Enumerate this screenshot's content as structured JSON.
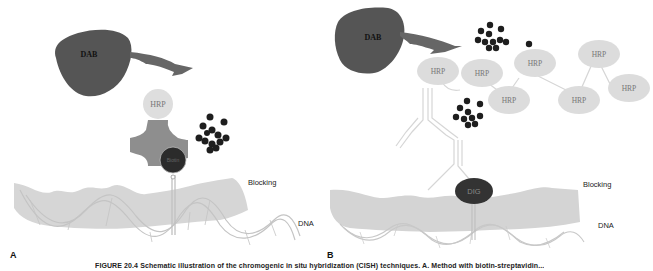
{
  "colors": {
    "dab": "#555555",
    "hrp": "#dcdcdc",
    "streptavidin": "#8c8c8c",
    "biotin": "#2b2b2b",
    "dig": "#333333",
    "precipitate": "#1e1e1e",
    "blocking": "#d4d4d4",
    "dna_strand": "#c8c8c8"
  },
  "panel_a": {
    "panel_label": "A",
    "dab_label": "DAB",
    "hrp_label": "HRP",
    "biotin_label": "Biotin",
    "blocking_label": "Blocking",
    "dna_label": "DNA"
  },
  "panel_b": {
    "panel_label": "B",
    "dab_label": "DAB",
    "hrp_labels": [
      "HRP",
      "HRP",
      "HRP",
      "HRP",
      "HRP",
      "HRP",
      "HRP"
    ],
    "dig_label": "DIG",
    "blocking_label": "Blocking",
    "dna_label": "DNA"
  },
  "caption": "FIGURE 20.4 Schematic illustration of the chromogenic in situ hybridization (CISH) techniques. A. Method with biotin-streptavidin..."
}
